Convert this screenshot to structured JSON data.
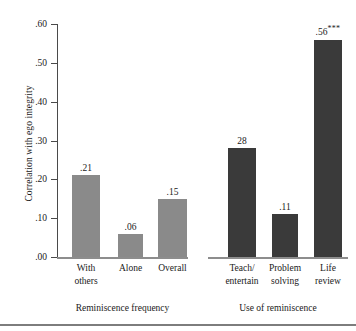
{
  "chart_data": {
    "type": "bar",
    "title": "",
    "xlabel": "",
    "ylabel": "Correlation with ego integrity",
    "ylim": [
      0.0,
      0.6
    ],
    "grid": false,
    "legend": "none",
    "y_ticks": [
      ".60",
      ".50",
      ".40",
      ".30",
      ".20",
      ".10",
      ".00"
    ],
    "y_tick_values": [
      0.6,
      0.5,
      0.4,
      0.3,
      0.2,
      0.1,
      0.0
    ],
    "groups": [
      {
        "name": "Reminiscence frequency",
        "color": "#8a8a8a",
        "categories": [
          "With\nothers",
          "Alone",
          "Overall"
        ],
        "category_lines": [
          [
            "With",
            "others"
          ],
          [
            "Alone"
          ],
          [
            "Overall"
          ]
        ],
        "values": [
          0.21,
          0.06,
          0.15
        ],
        "labels": [
          ".21",
          ".06",
          ".15"
        ],
        "significance": [
          "",
          "",
          ""
        ]
      },
      {
        "name": "Use of reminiscence",
        "color": "#3a3a3a",
        "categories": [
          "Teach/\nentertain",
          "Problem\nsolving",
          "Life\nreview"
        ],
        "category_lines": [
          [
            "Teach/",
            "entertain"
          ],
          [
            "Problem",
            "solving"
          ],
          [
            "Life",
            "review"
          ]
        ],
        "values": [
          0.28,
          0.11,
          0.56
        ],
        "labels": [
          "28",
          ".11",
          ".56"
        ],
        "significance": [
          "",
          "",
          "***"
        ]
      }
    ]
  },
  "axis": {
    "y_title": "Correlation with ego integrity",
    "ticks": [
      {
        "label": ".60",
        "value": 0.6
      },
      {
        "label": ".50",
        "value": 0.5
      },
      {
        "label": ".40",
        "value": 0.4
      },
      {
        "label": ".30",
        "value": 0.3
      },
      {
        "label": ".20",
        "value": 0.2
      },
      {
        "label": ".10",
        "value": 0.1
      },
      {
        "label": ".00",
        "value": 0.0
      }
    ]
  },
  "groups": [
    {
      "title": "Reminiscence frequency"
    },
    {
      "title": "Use of reminiscence"
    }
  ],
  "colors": {
    "bar_light": "#8a8a8a",
    "bar_dark": "#3a3a3a",
    "axis": "#4a4a4a",
    "baseline": "#8d8d8d",
    "text": "#1a1a1a",
    "background": "#ffffff"
  }
}
